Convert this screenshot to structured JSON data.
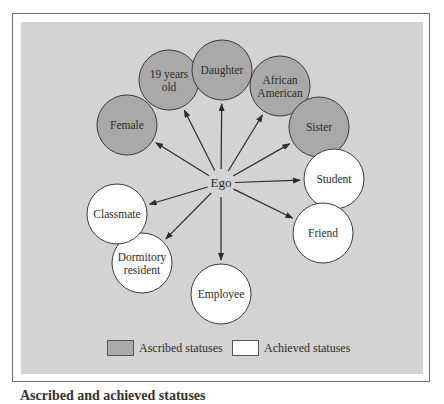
{
  "colors": {
    "panel": "#d3d3d3",
    "ascribed_fill": "#a9a9a9",
    "achieved_fill": "#ffffff",
    "outline": "#3a3a3a",
    "arrow": "#2b2b2b"
  },
  "center": {
    "label": "Ego",
    "x": 221,
    "y": 183
  },
  "nodes": [
    {
      "id": "female",
      "lines": [
        "Female"
      ],
      "type": "ascribed",
      "x": 127,
      "y": 125
    },
    {
      "id": "19-years-old",
      "lines": [
        "19 years",
        "old"
      ],
      "type": "ascribed",
      "x": 169,
      "y": 80
    },
    {
      "id": "daughter",
      "lines": [
        "Daughter"
      ],
      "type": "ascribed",
      "x": 222,
      "y": 70
    },
    {
      "id": "african-american",
      "lines": [
        "African",
        "American"
      ],
      "type": "ascribed",
      "x": 280,
      "y": 86
    },
    {
      "id": "sister",
      "lines": [
        "Sister"
      ],
      "type": "ascribed",
      "x": 319,
      "y": 127
    },
    {
      "id": "student",
      "lines": [
        "Student"
      ],
      "type": "achieved",
      "x": 334,
      "y": 179
    },
    {
      "id": "friend",
      "lines": [
        "Friend"
      ],
      "type": "achieved",
      "x": 323,
      "y": 233
    },
    {
      "id": "employee",
      "lines": [
        "Employee"
      ],
      "type": "achieved",
      "x": 221,
      "y": 294
    },
    {
      "id": "dormitory-resident",
      "lines": [
        "Dormitory",
        "resident"
      ],
      "type": "achieved",
      "x": 142,
      "y": 263
    },
    {
      "id": "classmate",
      "lines": [
        "Classmate"
      ],
      "type": "achieved",
      "x": 117,
      "y": 214
    }
  ],
  "legend": {
    "ascribed_label": "Ascribed statuses",
    "achieved_label": "Achieved statuses"
  },
  "caption": {
    "text": "Ascribed and achieved statuses"
  }
}
